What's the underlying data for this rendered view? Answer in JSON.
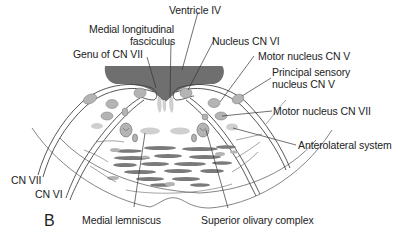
{
  "figure": {
    "panel_letter": "B",
    "colors": {
      "ventricle_fill": "#6f6f6f",
      "nucleus_fill": "#b4b4b4",
      "light_tract_fill": "#cfcfcf",
      "fiber_bundle_fill": "#7a7a7a",
      "outline": "#555555",
      "label_text": "#222222"
    }
  },
  "labels": {
    "ventricle_iv": "Ventricle IV",
    "mlf_line1": "Medial longitudinal",
    "mlf_line2": "fasciculus",
    "genu_cn_vii": "Genu of CN VII",
    "nucleus_cn_vi": "Nucleus CN VI",
    "motor_nucleus_cn_v": "Motor nucleus CN V",
    "principal_sensory_line1": "Principal sensory",
    "principal_sensory_line2": "nucleus CN V",
    "motor_nucleus_cn_vii": "Motor nucleus CN VII",
    "anterolateral_system": "Anterolateral system",
    "cn_vii": "CN VII",
    "cn_vi": "CN VI",
    "medial_lemniscus": "Medial lemniscus",
    "superior_olivary_complex": "Superior olivary complex"
  }
}
